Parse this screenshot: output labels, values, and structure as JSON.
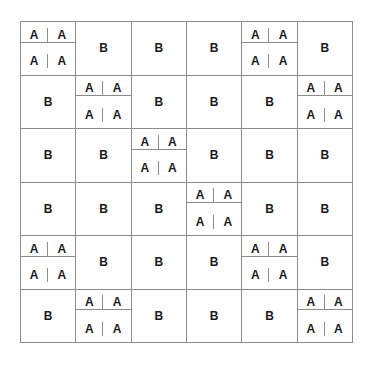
{
  "diagram": {
    "rows": 6,
    "cols": 6,
    "split_label": "A",
    "whole_label": "B",
    "grid": [
      [
        "A",
        "B",
        "B",
        "B",
        "A",
        "B"
      ],
      [
        "B",
        "A",
        "B",
        "B",
        "B",
        "A"
      ],
      [
        "B",
        "B",
        "A",
        "B",
        "B",
        "B"
      ],
      [
        "B",
        "B",
        "B",
        "A",
        "B",
        "B"
      ],
      [
        "A",
        "B",
        "B",
        "B",
        "A",
        "B"
      ],
      [
        "B",
        "A",
        "B",
        "B",
        "B",
        "A"
      ]
    ]
  }
}
